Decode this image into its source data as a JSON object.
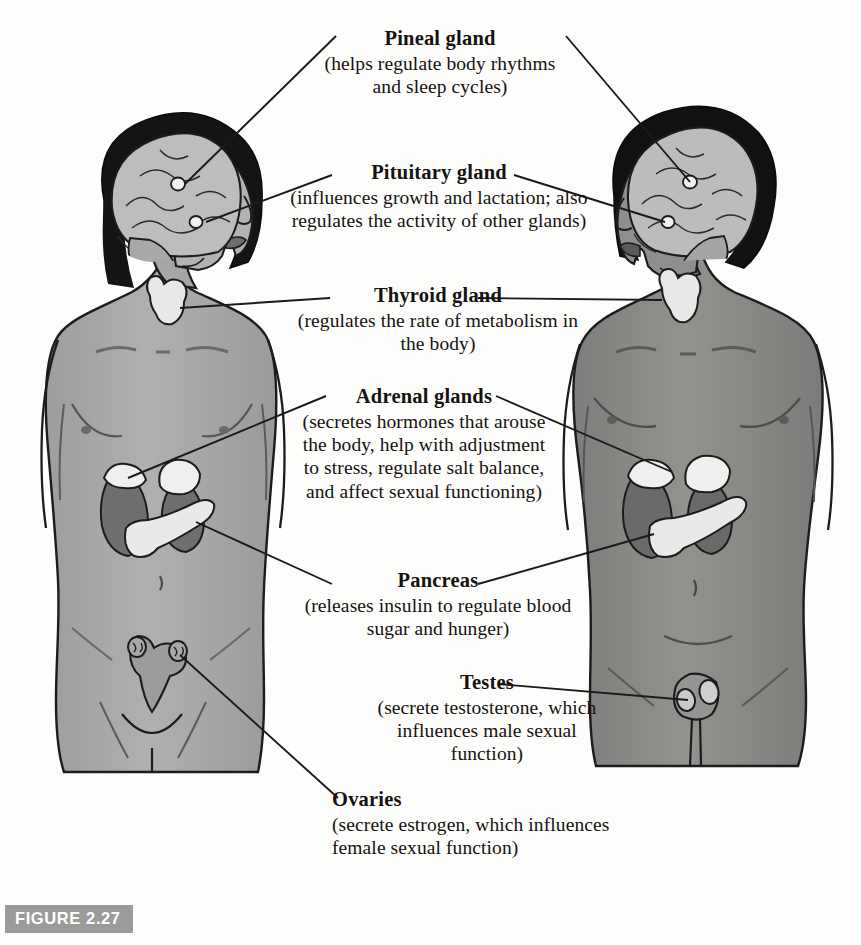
{
  "figure": {
    "badge": "FIGURE 2.27",
    "background_color": "#fdfdfc",
    "badge_color": "#9b9b99",
    "line_color": "#1a1a1a"
  },
  "labels": [
    {
      "id": "pineal",
      "heading": "Pineal gland",
      "body": "(helps regulate body rhythms and sleep cycles)",
      "align": "center"
    },
    {
      "id": "pituitary",
      "heading": "Pituitary gland",
      "body": "(influences growth and lactation; also regulates the activity of other glands)",
      "align": "center"
    },
    {
      "id": "thyroid",
      "heading": "Thyroid gland",
      "body": "(regulates the rate of metabolism in the body)",
      "align": "center"
    },
    {
      "id": "adrenal",
      "heading": "Adrenal glands",
      "body": "(secretes hormones that arouse the body, help with adjustment to stress, regulate salt balance, and affect sexual functioning)",
      "align": "center"
    },
    {
      "id": "pancreas",
      "heading": "Pancreas",
      "body": "(releases insulin to regulate blood sugar and hunger)",
      "align": "center"
    },
    {
      "id": "testes",
      "heading": "Testes",
      "body": "(secrete testosterone, which influences male sexual function)",
      "align": "center"
    },
    {
      "id": "ovaries",
      "heading": "Ovaries",
      "body": "(secrete estrogen, which influences female sexual function)",
      "align": "left"
    }
  ],
  "figures": [
    {
      "id": "female-figure",
      "sex": "female",
      "skin_color": "#a9a9a7",
      "hair_color": "#141414",
      "facing": "right",
      "organs": [
        "brain",
        "pineal-gland",
        "pituitary-gland",
        "thyroid-gland",
        "adrenal-glands",
        "kidneys",
        "pancreas",
        "uterus",
        "ovaries"
      ]
    },
    {
      "id": "male-figure",
      "sex": "male",
      "skin_color": "#8a8a88",
      "hair_color": "#111111",
      "facing": "left",
      "organs": [
        "brain",
        "pineal-gland",
        "pituitary-gland",
        "thyroid-gland",
        "adrenal-glands",
        "kidneys",
        "pancreas",
        "testes"
      ]
    }
  ],
  "colors": {
    "skin_light": "#a9a9a7",
    "skin_dark": "#8a8a88",
    "brain": "#b9b9b7",
    "organ_light": "#dededc",
    "kidney": "#6f6f6d",
    "outline": "#1c1c1c"
  }
}
